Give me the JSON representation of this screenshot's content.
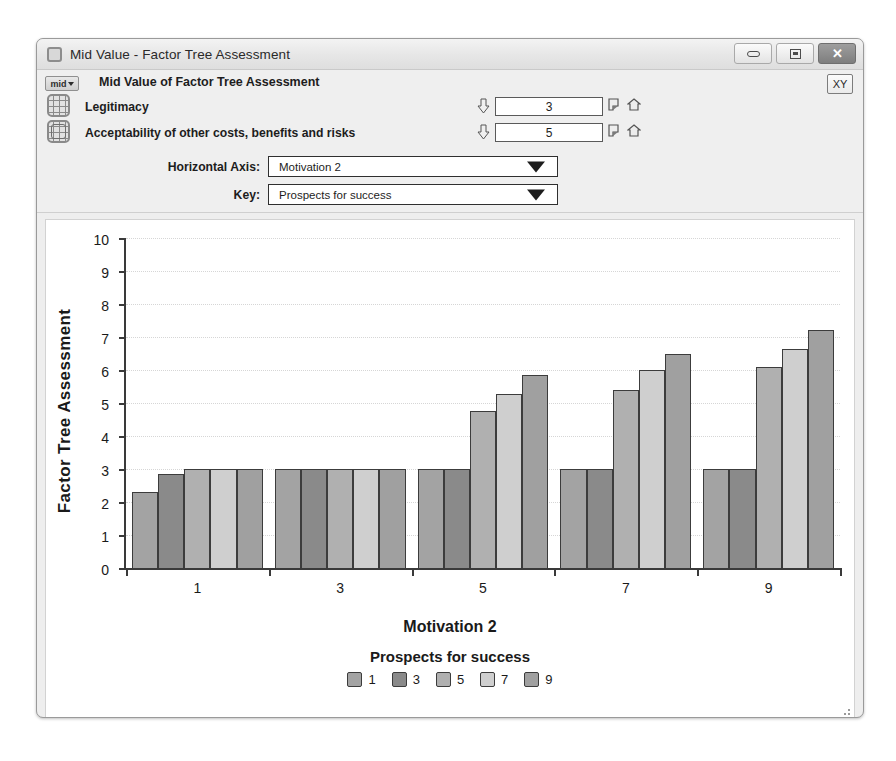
{
  "window": {
    "title": "Mid Value - Factor Tree Assessment",
    "icon": "window-icon",
    "buttons": {
      "minimize": "minimize-icon",
      "maximize": "maximize-icon",
      "close": "✕"
    }
  },
  "toolbar": {
    "mid_button_label": "mid",
    "heading": "Mid Value of Factor Tree Assessment",
    "xy_button_label": "XY",
    "criteria": [
      {
        "label": "Legitimacy",
        "value": "3"
      },
      {
        "label": "Acceptability of other costs, benefits  and risks",
        "value": "5"
      }
    ],
    "combos": [
      {
        "label": "Horizontal Axis:",
        "value": "Motivation 2"
      },
      {
        "label": "Key:",
        "value": "Prospects for success"
      }
    ]
  },
  "chart_data": {
    "type": "bar",
    "title": "",
    "xlabel": "Motivation 2",
    "ylabel": "Factor Tree Assessment",
    "categories": [
      "1",
      "3",
      "5",
      "7",
      "9"
    ],
    "ylim": [
      0,
      10
    ],
    "yticks": [
      0,
      1,
      2,
      3,
      4,
      5,
      6,
      7,
      8,
      9,
      10
    ],
    "grid": true,
    "legend_title": "Prospects for success",
    "legend_position": "bottom",
    "series": [
      {
        "name": "1",
        "color": "#a3a3a3",
        "values": [
          2.3,
          3.0,
          3.0,
          3.0,
          3.0
        ]
      },
      {
        "name": "3",
        "color": "#8a8a8a",
        "values": [
          2.85,
          3.0,
          3.0,
          3.0,
          3.0
        ]
      },
      {
        "name": "5",
        "color": "#b0b0b0",
        "values": [
          3.0,
          3.0,
          4.75,
          5.4,
          6.1
        ]
      },
      {
        "name": "7",
        "color": "#cfcfcf",
        "values": [
          3.0,
          3.0,
          5.28,
          6.0,
          6.65
        ]
      },
      {
        "name": "9",
        "color": "#a0a0a0",
        "values": [
          3.0,
          3.0,
          5.85,
          6.5,
          7.2
        ]
      }
    ]
  }
}
